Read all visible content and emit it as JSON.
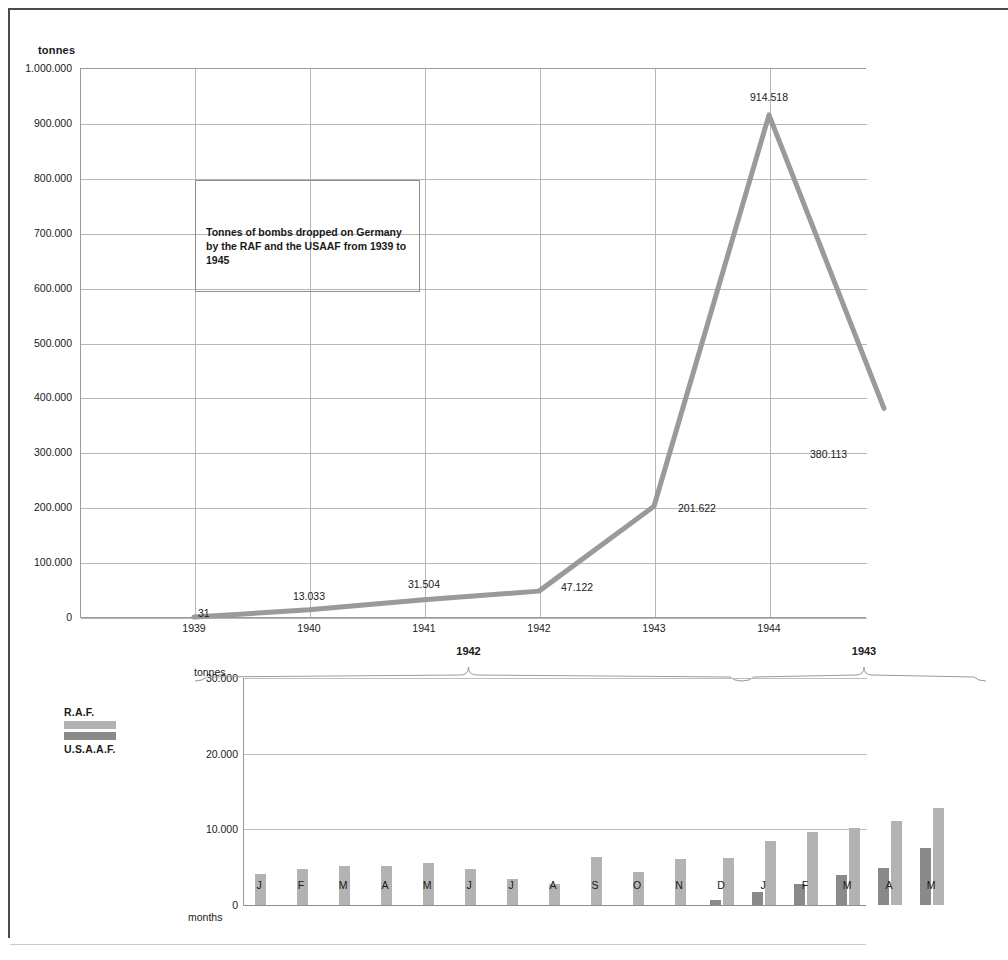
{
  "page": {
    "unit_label_top": "tonnes",
    "unit_label_bottom": "tonnes",
    "months_axis_label": "months"
  },
  "title_box": {
    "text": "Tonnes of bombs dropped on Germany by the RAF and the USAAF from 1939 to 1945"
  },
  "legend": {
    "items": [
      {
        "label": "R.A.F.",
        "color": "#b3b3b3"
      },
      {
        "label": "U.S.A.A.F.",
        "color": "#8a8a8a"
      }
    ]
  },
  "colors": {
    "line": "#9a9a9a",
    "grid": "#b6b6b6",
    "axis": "#8e8e8e",
    "raf": "#b3b3b3",
    "usaaf": "#8a8a8a",
    "text": "#1a1a1a"
  },
  "chart_data": [
    {
      "type": "line",
      "title": "Tonnes of bombs dropped on Germany by the RAF and the USAAF from 1939 to 1945",
      "xlabel": "",
      "ylabel": "tonnes",
      "ylim": [
        0,
        1000000
      ],
      "grid": true,
      "legend_position": "none",
      "ytick_labels": [
        "1.000.000",
        "900.000",
        "800.000",
        "700.000",
        "600.000",
        "500.000",
        "400.000",
        "300.000",
        "200.000",
        "100.000",
        "0"
      ],
      "ytick_values": [
        1000000,
        900000,
        800000,
        700000,
        600000,
        500000,
        400000,
        300000,
        200000,
        100000,
        0
      ],
      "categories": [
        "1939",
        "1940",
        "1941",
        "1942",
        "1943",
        "1944",
        "1945"
      ],
      "visible_categories": [
        "1939",
        "1940",
        "1941",
        "1942",
        "1943",
        "1944"
      ],
      "values": [
        31,
        13033,
        31504,
        47122,
        201622,
        914518,
        380113
      ],
      "point_labels": [
        "31",
        "13.033",
        "31.504",
        "47.122",
        "201.622",
        "914.518",
        "380.113"
      ],
      "note": "1945 point and label lie beyond the right crop edge; 380.113 label is visible"
    },
    {
      "type": "bar",
      "title": "",
      "xlabel": "months",
      "ylabel": "tonnes",
      "ylim": [
        0,
        30000
      ],
      "grid": true,
      "legend_position": "left",
      "ytick_labels": [
        "30.000",
        "20.000",
        "10.000",
        "0"
      ],
      "ytick_values": [
        30000,
        20000,
        10000,
        0
      ],
      "group_years": [
        "1942",
        "1943"
      ],
      "categories": [
        "J",
        "F",
        "M",
        "A",
        "M",
        "J",
        "J",
        "A",
        "S",
        "O",
        "N",
        "D",
        "J",
        "F",
        "M",
        "A",
        "M"
      ],
      "series": [
        {
          "name": "U.S.A.A.F.",
          "color": "#8a8a8a",
          "values": [
            0,
            0,
            0,
            0,
            0,
            0,
            0,
            0,
            0,
            0,
            0,
            700,
            1700,
            2800,
            4000,
            4900,
            7600
          ]
        },
        {
          "name": "R.A.F.",
          "color": "#b3b3b3",
          "values": [
            4100,
            4700,
            5100,
            5200,
            5600,
            4800,
            3400,
            2800,
            6300,
            4300,
            6100,
            6200,
            8400,
            9600,
            10200,
            11100,
            12800
          ]
        }
      ]
    }
  ]
}
